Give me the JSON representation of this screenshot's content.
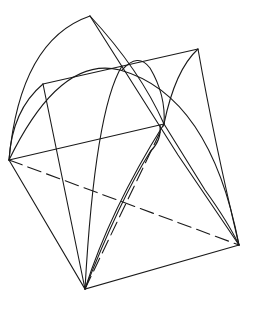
{
  "diagram": {
    "title": "",
    "stroke_color": "#1a1a1a",
    "background": "#ffffff",
    "points": {
      "left_corner": [
        9,
        160
      ],
      "bottom_corner": [
        85,
        289
      ],
      "right_corner": [
        239,
        245
      ],
      "back_corner": [
        164,
        124
      ],
      "apex": [
        90,
        16
      ],
      "top_left": [
        43,
        84
      ],
      "top_right": [
        198,
        49
      ],
      "inner_arc_peak": [
        137,
        60
      ]
    }
  }
}
